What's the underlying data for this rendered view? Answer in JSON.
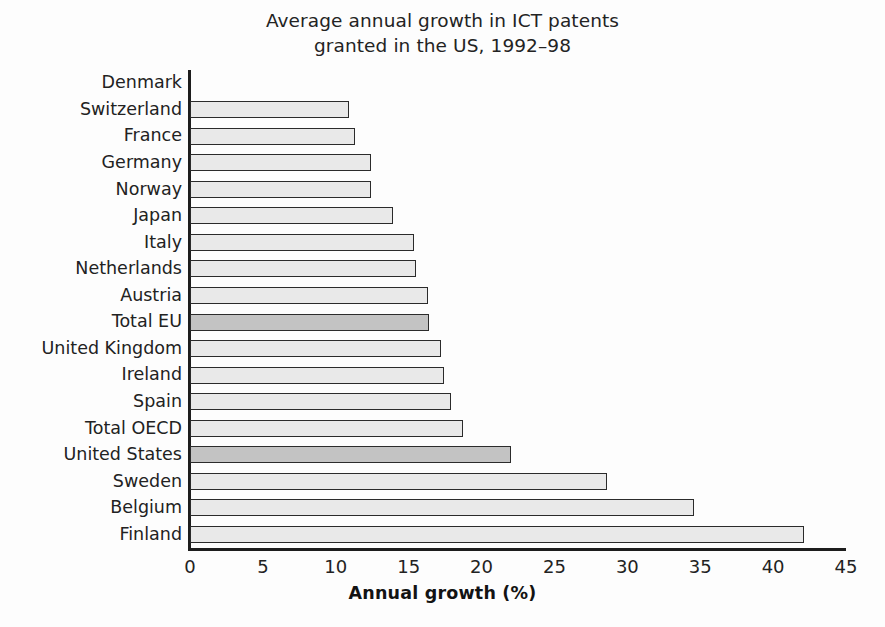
{
  "chart_data": {
    "type": "bar",
    "orientation": "horizontal",
    "title": "Average annual growth in ICT patents granted in the US, 1992–98",
    "title_lines": [
      "Average annual growth in ICT patents",
      "granted in the US, 1992–98"
    ],
    "xlabel": "Annual growth (%)",
    "ylabel": "",
    "xlim": [
      0,
      45
    ],
    "xticks": [
      0,
      5,
      10,
      15,
      20,
      25,
      30,
      35,
      40,
      45
    ],
    "xtick_labels": [
      "0",
      "5",
      "10",
      "15",
      "20",
      "25",
      "30",
      "35",
      "40",
      "45"
    ],
    "grid": false,
    "legend": "none",
    "categories": [
      "Denmark",
      "Switzerland",
      "France",
      "Germany",
      "Norway",
      "Japan",
      "Italy",
      "Netherlands",
      "Austria",
      "Total EU",
      "United Kingdom",
      "Ireland",
      "Spain",
      "Total OECD",
      "United States",
      "Sweden",
      "Belgium",
      "Finland"
    ],
    "values": [
      0,
      10.9,
      11.3,
      12.4,
      12.4,
      13.9,
      15.4,
      15.5,
      16.3,
      16.4,
      17.2,
      17.4,
      17.9,
      18.7,
      22.0,
      28.6,
      34.6,
      42.1
    ],
    "highlighted": [
      "Total EU",
      "United States"
    ],
    "colors": {
      "bar_fill": "#e9e9e9",
      "bar_highlight_fill": "#c3c3c3",
      "bar_edge": "#2b2b2b",
      "axis": "#1d1d1d",
      "text": "#222222",
      "background": "#fdfdfd"
    }
  }
}
